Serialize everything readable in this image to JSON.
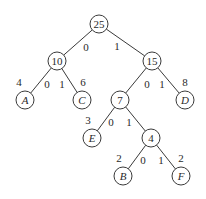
{
  "diagram": {
    "type": "huffman-tree",
    "nodes": [
      {
        "id": "n25",
        "label": "25",
        "x": 99,
        "y": 24,
        "leaf": false
      },
      {
        "id": "n10",
        "label": "10",
        "x": 57,
        "y": 61,
        "leaf": false
      },
      {
        "id": "n15",
        "label": "15",
        "x": 152,
        "y": 61,
        "leaf": false
      },
      {
        "id": "A",
        "label": "A",
        "x": 25,
        "y": 100,
        "leaf": true,
        "weight": "4",
        "wx": 19,
        "wy": 82
      },
      {
        "id": "C",
        "label": "C",
        "x": 82,
        "y": 100,
        "leaf": true,
        "weight": "6",
        "wx": 83,
        "wy": 82
      },
      {
        "id": "n7",
        "label": "7",
        "x": 120,
        "y": 100,
        "leaf": false
      },
      {
        "id": "D",
        "label": "D",
        "x": 185,
        "y": 100,
        "leaf": true,
        "weight": "8",
        "wx": 185,
        "wy": 82
      },
      {
        "id": "E",
        "label": "E",
        "x": 92,
        "y": 138,
        "leaf": true,
        "weight": "3",
        "wx": 88,
        "wy": 120
      },
      {
        "id": "n4",
        "label": "4",
        "x": 151,
        "y": 138,
        "leaf": false
      },
      {
        "id": "B",
        "label": "B",
        "x": 123,
        "y": 176,
        "leaf": true,
        "weight": "2",
        "wx": 119,
        "wy": 158
      },
      {
        "id": "F",
        "label": "F",
        "x": 181,
        "y": 176,
        "leaf": true,
        "weight": "2",
        "wx": 181,
        "wy": 158
      }
    ],
    "edges": [
      {
        "from": "n25",
        "to": "n10",
        "bit": "0",
        "bx": 86,
        "by": 47
      },
      {
        "from": "n25",
        "to": "n15",
        "bit": "1",
        "bx": 117,
        "by": 46
      },
      {
        "from": "n10",
        "to": "A",
        "bit": "0",
        "bx": 47,
        "by": 84
      },
      {
        "from": "n10",
        "to": "C",
        "bit": "1",
        "bx": 62,
        "by": 84
      },
      {
        "from": "n15",
        "to": "n7",
        "bit": "0",
        "bx": 147,
        "by": 84
      },
      {
        "from": "n15",
        "to": "D",
        "bit": "1",
        "bx": 162,
        "by": 84
      },
      {
        "from": "n7",
        "to": "E",
        "bit": "0",
        "bx": 111,
        "by": 122
      },
      {
        "from": "n7",
        "to": "n4",
        "bit": "1",
        "bx": 129,
        "by": 122
      },
      {
        "from": "n4",
        "to": "B",
        "bit": "0",
        "bx": 143,
        "by": 160
      },
      {
        "from": "n4",
        "to": "F",
        "bit": "1",
        "bx": 161,
        "by": 160
      }
    ],
    "radius": 9
  }
}
